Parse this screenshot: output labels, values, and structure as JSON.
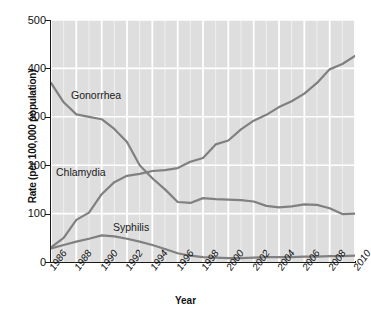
{
  "chart_data": {
    "type": "line",
    "title": "",
    "subtitle": "",
    "xlabel": "Year",
    "ylabel": "Rate (per 100,000 population)",
    "xlim": [
      1986,
      2010
    ],
    "ylim": [
      0,
      500
    ],
    "grid": true,
    "legend_position": "inline-annotations",
    "x": [
      1986,
      1987,
      1988,
      1989,
      1990,
      1991,
      1992,
      1993,
      1994,
      1995,
      1996,
      1997,
      1998,
      1999,
      2000,
      2001,
      2002,
      2003,
      2004,
      2005,
      2006,
      2007,
      2008,
      2009,
      2010
    ],
    "xticks": [
      "1986",
      "1988",
      "1990",
      "1992",
      "1994",
      "1996",
      "1998",
      "2000",
      "2002",
      "2004",
      "2006",
      "2008",
      "2010"
    ],
    "yticks": [
      "0",
      "100",
      "200",
      "300",
      "400",
      "500"
    ],
    "series": [
      {
        "name": "Gonorrhea",
        "values": [
          370,
          330,
          305,
          300,
          295,
          275,
          248,
          200,
          173,
          150,
          124,
          122,
          132,
          130,
          129,
          128,
          125,
          116,
          113,
          115,
          119,
          118,
          111,
          99,
          100
        ]
      },
      {
        "name": "Chlamydia",
        "values": [
          30,
          50,
          87,
          102,
          140,
          165,
          178,
          182,
          188,
          190,
          194,
          207,
          215,
          243,
          251,
          274,
          292,
          304,
          320,
          332,
          348,
          370,
          398,
          409,
          426
        ]
      },
      {
        "name": "Syphilis",
        "values": [
          28,
          35,
          42,
          48,
          55,
          53,
          48,
          42,
          35,
          27,
          18,
          13,
          10,
          9,
          8,
          8,
          9,
          10,
          10,
          10,
          11,
          11,
          12,
          12,
          13
        ]
      }
    ],
    "annotations": [
      {
        "label": "Gonorrhea",
        "x": 1987.6,
        "y": 335
      },
      {
        "label": "Chlamydia",
        "x": 1986.3,
        "y": 180
      },
      {
        "label": "Syphilis",
        "x": 1991.8,
        "y": 68
      }
    ],
    "colors": {
      "plot_background": "#dedede",
      "gridline": "#ffffff",
      "series_line": "#808080",
      "axis": "#1a1a1a",
      "text": "#111111"
    }
  }
}
